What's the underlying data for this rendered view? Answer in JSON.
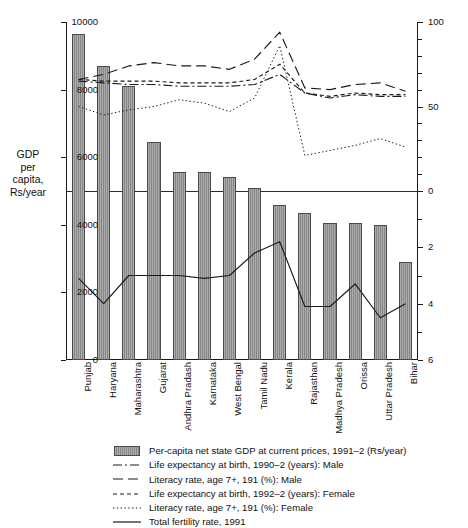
{
  "chart_data": {
    "type": "bar",
    "title": "",
    "xlabel": "",
    "ylabel": "GDP per capita, Rs/year",
    "ylim": [
      0,
      10000
    ],
    "grid": false,
    "legend_position": "bottom",
    "categories": [
      "Punjab",
      "Haryana",
      "Maharashtra",
      "Gujarat",
      "Andhra Pradash",
      "Karnataka",
      "West Bengal",
      "Tamil Nadu",
      "Kerala",
      "Rajasthan",
      "Madhya Pradesh",
      "Orissa",
      "Uttar Pradesh",
      "Bihar"
    ],
    "axes": {
      "left": {
        "label": "GDP per capita, Rs/year",
        "ticks": [
          "10000",
          "8000",
          "6000",
          "4000",
          "2000",
          "0"
        ],
        "values": [
          10000,
          8000,
          6000,
          4000,
          2000,
          0
        ],
        "min": 0,
        "max": 10000
      },
      "right_upper": {
        "ticks": [
          "100",
          "50",
          "0"
        ],
        "values": [
          100,
          50,
          0
        ],
        "min": 0,
        "max": 100,
        "note": "years / percent scale for life-expectancy and literacy series"
      },
      "right_lower": {
        "ticks": [
          "0",
          "2",
          "4",
          "6"
        ],
        "values": [
          0,
          2,
          4,
          6
        ],
        "min": 0,
        "max": 6,
        "inverted": true,
        "note": "total fertility rate scale, increases downward"
      }
    },
    "series": [
      {
        "name": "Per-capita net state GDP at current prices, 1991–2 (Rs/year)",
        "kind": "bar",
        "axis": "left",
        "values": [
          9650,
          8700,
          8120,
          6450,
          5550,
          5550,
          5400,
          5100,
          4600,
          4350,
          4050,
          4050,
          4000,
          2900
        ]
      },
      {
        "name": "Life expectancy at birth, 1990–2 (years): Male",
        "kind": "line",
        "style": "dash-dot",
        "axis": "right_upper",
        "values": [
          65,
          64,
          63,
          63,
          62,
          62,
          62,
          63,
          69,
          58,
          55,
          57,
          56,
          56
        ]
      },
      {
        "name": "Literacy rate, age 7+, 191 (%): Male",
        "kind": "line",
        "style": "long-dash",
        "axis": "right_upper",
        "values": [
          66,
          69,
          74,
          76,
          74,
          74,
          72,
          78,
          94,
          61,
          60,
          63,
          64,
          59
        ]
      },
      {
        "name": "Life expectancy at birth, 1992–2 (years): Female",
        "kind": "line",
        "style": "short-dash",
        "axis": "right_upper",
        "values": [
          66,
          65,
          65,
          65,
          64,
          64,
          64,
          66,
          75,
          58,
          56,
          58,
          57,
          57
        ]
      },
      {
        "name": "Literacy rate, age 7+, 191 (%): Female",
        "kind": "line",
        "style": "dotted",
        "axis": "right_upper",
        "values": [
          50,
          45,
          48,
          50,
          54,
          52,
          47,
          55,
          86,
          21,
          24,
          27,
          31,
          26
        ]
      },
      {
        "name": "Total fertility rate, 1991",
        "kind": "line",
        "style": "solid",
        "axis": "right_lower",
        "values": [
          3.1,
          4.0,
          3.0,
          3.0,
          3.0,
          3.1,
          3.0,
          2.2,
          1.8,
          4.1,
          4.1,
          3.3,
          4.5,
          4.0
        ]
      }
    ]
  },
  "axis_title": {
    "line1": "GDP",
    "line2": "per",
    "line3": "capita,",
    "line4": "Rs/year"
  },
  "legend": {
    "items": [
      {
        "label": "Per-capita net state GDP at current prices, 1991–2 (Rs/year)",
        "key": "bar-swatch"
      },
      {
        "label": "Life expectancy at birth, 1990–2 (years): Male",
        "key": "dash-dot-line"
      },
      {
        "label": "Literacy rate, age 7+, 191 (%): Male",
        "key": "long-dash-line"
      },
      {
        "label": "Life expectancy at birth, 1992–2 (years): Female",
        "key": "short-dash-line"
      },
      {
        "label": "Literacy rate, age 7+, 191 (%): Female",
        "key": "dotted-line"
      },
      {
        "label": "Total fertility rate, 1991",
        "key": "solid-line"
      }
    ]
  },
  "colors": {
    "bar_fill": "#8d8d8d",
    "bar_stroke": "#4a4a4a",
    "line": "#1a1a1a",
    "axis": "#1a1a1a",
    "background": "#ffffff"
  }
}
